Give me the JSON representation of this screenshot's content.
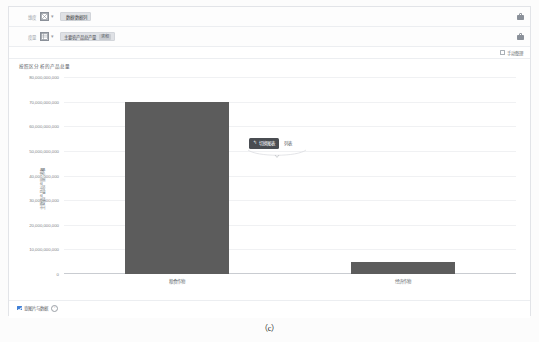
{
  "shelves": [
    {
      "label": "维度",
      "icon": "dimension-icon",
      "aggregate": "",
      "field": "数据/数据列",
      "pill": "",
      "lock": "lock-icon"
    },
    {
      "label": "度量",
      "icon": "measure-icon",
      "aggregate": "Σ",
      "field": "主要农产品总产量",
      "pill": "求和",
      "lock": "lock-icon"
    }
  ],
  "options": {
    "checkbox_label": "手动整理",
    "checked": false
  },
  "chart_title": "按照区分析的产品总量",
  "popup": {
    "button_label": "切换图表",
    "button_icon": "chevron-left-icon",
    "side_text": "列表"
  },
  "footer": {
    "checkbox_label": "查图片与数据",
    "checked": true,
    "info_icon": "info-icon"
  },
  "caption": "（c）",
  "colors": {
    "bar": "#5c5c5c",
    "accent": "#3f7fd6",
    "grid": "#f0f1f3",
    "axis": "#c9ccd1",
    "popup_bg": "#4a4d52"
  },
  "chart_data": {
    "type": "bar",
    "title": "按照区分析的产品总量",
    "xlabel": "一级分类",
    "ylabel": "主要农产品总产量 求和",
    "categories": [
      "粮食作物",
      "经济作物"
    ],
    "values": [
      70000000000,
      5000000000
    ],
    "ylim": [
      0,
      80000000000
    ],
    "yticks": [
      0,
      10000000000,
      20000000000,
      30000000000,
      40000000000,
      50000000000,
      60000000000,
      70000000000,
      80000000000
    ],
    "ytick_labels": [
      "0",
      "10,000,000,000",
      "20,000,000,000",
      "30,000,000,000",
      "40,000,000,000",
      "50,000,000,000",
      "60,000,000,000",
      "70,000,000,000",
      "80,000,000,000"
    ],
    "grid": true,
    "legend": false,
    "series": [
      {
        "name": "主要农产品总产量 求和",
        "values": [
          70000000000,
          5000000000
        ]
      }
    ]
  }
}
